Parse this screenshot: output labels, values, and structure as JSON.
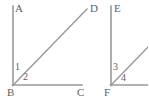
{
  "figure": {
    "background_color": "#ffffff",
    "line_color": "#9a9a9a",
    "label_color": "#5e5e5e",
    "line_width": 1.6,
    "width": 148,
    "height": 99
  },
  "left_figure": {
    "name": "angle-figure-abdc",
    "vertex": {
      "name": "B",
      "x": 13,
      "y": 85
    },
    "rays": [
      {
        "name": "ray-BA",
        "endpoint_label": "A",
        "x1": 13,
        "y1": 85,
        "x2": 13,
        "y2": 6
      },
      {
        "name": "ray-BD",
        "endpoint_label": "D",
        "x1": 13,
        "y1": 85,
        "x2": 87,
        "y2": 9
      },
      {
        "name": "ray-BC",
        "endpoint_label": "C",
        "x1": 13,
        "y1": 85,
        "x2": 82,
        "y2": 85
      }
    ],
    "vertex_labels": {
      "A": "A",
      "B": "B",
      "C": "C",
      "D": "D"
    },
    "angle_labels": {
      "between_BA_and_BD": "1",
      "between_BD_and_BC": "2"
    }
  },
  "right_figure": {
    "name": "angle-figure-ef",
    "vertex": {
      "name": "F",
      "x": 111,
      "y": 85
    },
    "rays": [
      {
        "name": "ray-FE",
        "endpoint_label": "E",
        "x1": 111,
        "y1": 85,
        "x2": 111,
        "y2": 6
      },
      {
        "name": "ray-F-diagonal",
        "endpoint_label": "",
        "x1": 111,
        "y1": 85,
        "x2": 148,
        "y2": 47
      },
      {
        "name": "ray-F-horizontal",
        "endpoint_label": "",
        "x1": 111,
        "y1": 85,
        "x2": 148,
        "y2": 85
      }
    ],
    "vertex_labels": {
      "E": "E",
      "F": "F"
    },
    "angle_labels": {
      "between_FE_and_diagonal": "3",
      "between_diagonal_and_horizontal": "4"
    }
  }
}
